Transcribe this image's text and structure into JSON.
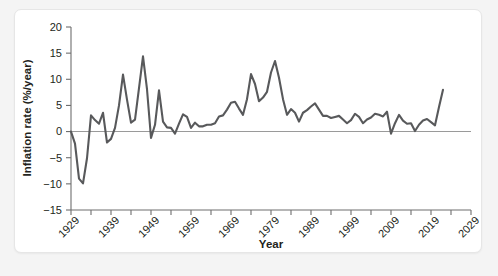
{
  "chart_data": {
    "type": "line",
    "title": "",
    "xlabel": "Year",
    "ylabel": "Inflation rate (%/year)",
    "xlim": [
      1929,
      2029
    ],
    "ylim": [
      -15,
      20
    ],
    "ytick_step": 5,
    "xtick_step_minor": 5,
    "xtick_step_major": 10,
    "grid": false,
    "legend": null,
    "zero_reference_line": true,
    "line_color": "#58595b",
    "axis_color": "#6e6e6e",
    "yticks": [
      20,
      15,
      10,
      5,
      0,
      -5,
      -10,
      -15
    ],
    "ytick_labels": [
      "20",
      "15",
      "10",
      "5",
      "0",
      "−5",
      "−10",
      "−15"
    ],
    "xticks": [
      1929,
      1934,
      1939,
      1944,
      1949,
      1954,
      1959,
      1964,
      1969,
      1974,
      1979,
      1984,
      1989,
      1994,
      1999,
      2004,
      2009,
      2014,
      2019,
      2024,
      2029
    ],
    "xtick_labels": [
      {
        "year": 1929,
        "label": "1929"
      },
      {
        "year": 1939,
        "label": "1939"
      },
      {
        "year": 1949,
        "label": "1949"
      },
      {
        "year": 1959,
        "label": "1959"
      },
      {
        "year": 1969,
        "label": "1969"
      },
      {
        "year": 1979,
        "label": "1979"
      },
      {
        "year": 1989,
        "label": "1989"
      },
      {
        "year": 1999,
        "label": "1999"
      },
      {
        "year": 2009,
        "label": "2009"
      },
      {
        "year": 2019,
        "label": "2019"
      },
      {
        "year": 2029,
        "label": "2029"
      }
    ],
    "x": [
      1929,
      1930,
      1931,
      1932,
      1933,
      1934,
      1935,
      1936,
      1937,
      1938,
      1939,
      1940,
      1941,
      1942,
      1943,
      1944,
      1945,
      1946,
      1947,
      1948,
      1949,
      1950,
      1951,
      1952,
      1953,
      1954,
      1955,
      1956,
      1957,
      1958,
      1959,
      1960,
      1961,
      1962,
      1963,
      1964,
      1965,
      1966,
      1967,
      1968,
      1969,
      1970,
      1971,
      1972,
      1973,
      1974,
      1975,
      1976,
      1977,
      1978,
      1979,
      1980,
      1981,
      1982,
      1983,
      1984,
      1985,
      1986,
      1987,
      1988,
      1989,
      1990,
      1991,
      1992,
      1993,
      1994,
      1995,
      1996,
      1997,
      1998,
      1999,
      2000,
      2001,
      2002,
      2003,
      2004,
      2005,
      2006,
      2007,
      2008,
      2009,
      2010,
      2011,
      2012,
      2013,
      2014,
      2015,
      2016,
      2017,
      2018,
      2019,
      2020,
      2021,
      2022
    ],
    "values": [
      0.0,
      -2.3,
      -9.0,
      -9.9,
      -5.1,
      3.1,
      2.2,
      1.5,
      3.6,
      -2.1,
      -1.4,
      0.7,
      5.0,
      10.9,
      6.1,
      1.7,
      2.3,
      8.3,
      14.4,
      8.1,
      -1.2,
      1.3,
      7.9,
      1.9,
      0.8,
      0.7,
      -0.4,
      1.5,
      3.3,
      2.8,
      0.7,
      1.7,
      1.0,
      1.0,
      1.3,
      1.3,
      1.6,
      2.9,
      3.1,
      4.2,
      5.5,
      5.7,
      4.4,
      3.2,
      6.2,
      11.0,
      9.1,
      5.8,
      6.5,
      7.6,
      11.3,
      13.5,
      10.3,
      6.2,
      3.2,
      4.3,
      3.6,
      1.9,
      3.6,
      4.1,
      4.8,
      5.4,
      4.2,
      3.0,
      3.0,
      2.6,
      2.8,
      3.0,
      2.3,
      1.6,
      2.2,
      3.4,
      2.8,
      1.6,
      2.3,
      2.7,
      3.4,
      3.2,
      2.9,
      3.8,
      -0.4,
      1.6,
      3.2,
      2.1,
      1.5,
      1.6,
      0.1,
      1.3,
      2.1,
      2.4,
      1.8,
      1.2,
      4.7,
      8.0
    ],
    "units": "%/year",
    "source_note": ""
  },
  "axes": {
    "x_title": "Year",
    "y_title": "Inflation rate (%/year)"
  }
}
